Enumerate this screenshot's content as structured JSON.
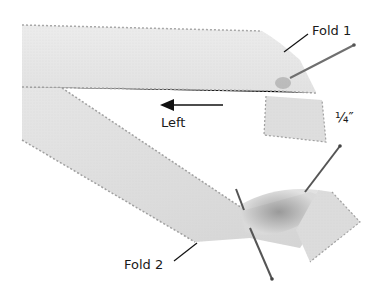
{
  "image": {
    "subject": "satin ribbon folding instruction photo",
    "background_color": "#ffffff",
    "ribbon_color": "#e9e9e9",
    "ribbon_shadow_color": "#bdbdbd",
    "stitch_color": "#9a9a9a",
    "pin_color": "#555555"
  },
  "labels": {
    "fold1": "Fold 1",
    "direction": "Left",
    "measurement": "¼″",
    "fold2": "Fold 2"
  },
  "annotations": {
    "arrow": {
      "direction": "left",
      "label_ref": "direction"
    },
    "leader_lines": [
      "fold1",
      "fold2"
    ],
    "pins": 4
  }
}
